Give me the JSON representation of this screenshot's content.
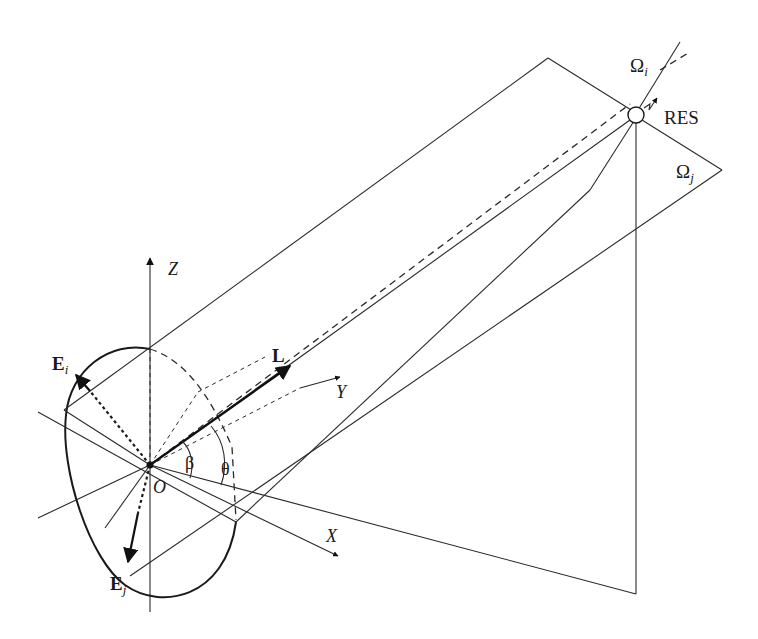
{
  "figure": {
    "type": "3D geometry diagram",
    "labels": {
      "z_axis": "Z",
      "y_axis": "Y",
      "x_axis": "X",
      "origin": "O",
      "vector_L": "L",
      "vector_Ei": "E",
      "vector_Ei_sub": "i",
      "vector_Ej": "E",
      "vector_Ej_sub": "j",
      "angle_beta": "β",
      "angle_theta": "θ",
      "plane_omega_i": "Ω",
      "plane_omega_i_sub": "i",
      "plane_omega_j": "Ω",
      "plane_omega_j_sub": "j",
      "receiver": "RES"
    },
    "colors": {
      "line": "#2a2a2a",
      "background": "#ffffff"
    }
  }
}
